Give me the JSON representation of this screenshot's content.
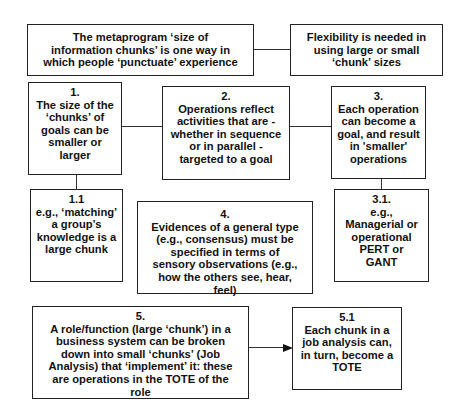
{
  "diagram": {
    "boxes": {
      "intro": {
        "text": "The metaprogram ‘size of information chunks’ is one way in which people ‘punctuate’ experience"
      },
      "flexibility": {
        "text": "Flexibility is needed in using large or small ‘chunk’ sizes"
      },
      "b1": {
        "num": "1.",
        "text": "The size of the ‘chunks’ of goals can be smaller or larger"
      },
      "b2": {
        "num": "2.",
        "text": "Operations reflect activities that are - whether in sequence or in parallel - targeted to a goal"
      },
      "b3": {
        "num": "3.",
        "text": "Each operation can become a goal, and result in 'smaller' operations"
      },
      "b1_1": {
        "num": "1.1",
        "text": "e.g., ‘matching’ a group’s knowledge is a large chunk"
      },
      "b4": {
        "num": "4.",
        "text": "Evidences of a general type (e.g., consensus) must be specified in terms of sensory observations (e.g., how the others see, hear, feel)"
      },
      "b3_1": {
        "num": "3.1.",
        "text": "e.g., Managerial or operational PERT or GANT"
      },
      "b5": {
        "num": "5.",
        "text": "A role/function (large ‘chunk’) in a business system can be broken down into small ‘chunks’ (Job Analysis) that ‘implement’ it: these are operations in the TOTE of the role"
      },
      "b5_1": {
        "num": "5.1",
        "text": "Each chunk in a job analysis can, in turn, become a TOTE"
      }
    },
    "connections": [
      {
        "from": "intro",
        "to": "flexibility",
        "type": "line"
      },
      {
        "from": "b1",
        "to": "b2",
        "type": "line"
      },
      {
        "from": "b2",
        "to": "b3",
        "type": "line"
      },
      {
        "from": "b1",
        "to": "b1_1",
        "type": "line"
      },
      {
        "from": "b3",
        "to": "b3_1",
        "type": "line"
      },
      {
        "from": "b5",
        "to": "b5_1",
        "type": "arrow"
      }
    ]
  }
}
